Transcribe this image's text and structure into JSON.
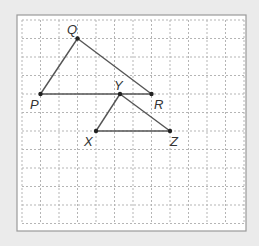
{
  "diagram": {
    "background": "#ebebeb",
    "frame": {
      "x": 17,
      "y": 15,
      "width": 229,
      "height": 216,
      "fill": "#ffffff",
      "stroke": "#9a9a9a"
    },
    "grid": {
      "x0": 22,
      "y0": 20,
      "spacing": 18.5,
      "cols": 12,
      "rows": 11,
      "color": "#b5b5b5",
      "dash": "2,2"
    },
    "line_color": "#555555",
    "point_color": "#222222",
    "points": [
      {
        "name": "Q",
        "x": 77.5,
        "y": 38.5,
        "lx": 67,
        "ly": 34
      },
      {
        "name": "P",
        "x": 40.5,
        "y": 94,
        "lx": 30,
        "ly": 109
      },
      {
        "name": "R",
        "x": 151.5,
        "y": 94,
        "lx": 154,
        "ly": 109
      },
      {
        "name": "Y",
        "x": 120,
        "y": 94,
        "lx": 114,
        "ly": 90
      },
      {
        "name": "X",
        "x": 96,
        "y": 131,
        "lx": 84,
        "ly": 146
      },
      {
        "name": "Z",
        "x": 170,
        "y": 131,
        "lx": 170,
        "ly": 146
      }
    ],
    "segments": [
      [
        "P",
        "Q"
      ],
      [
        "Q",
        "R"
      ],
      [
        "P",
        "R"
      ],
      [
        "Y",
        "X"
      ],
      [
        "Y",
        "Z"
      ],
      [
        "X",
        "Z"
      ]
    ],
    "triangles": [
      "PQR",
      "XYZ"
    ]
  }
}
